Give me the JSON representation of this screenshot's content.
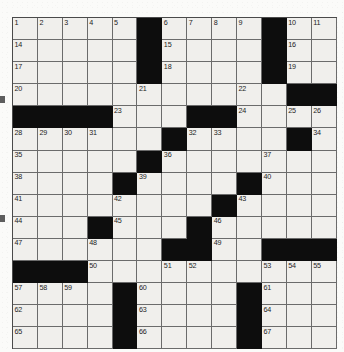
{
  "puzzle": {
    "kind": "crossword-grid",
    "columns": 13,
    "rows": 15,
    "colors": {
      "block": "#0d0d0d",
      "open": "#f0efec",
      "grid_line": "#6b6b6b",
      "border": "#4a4a4a",
      "number_text": "#1d1d1d",
      "paper": "#fbfbf9"
    },
    "clue_number_range": {
      "first": 1,
      "last": 67
    },
    "counts": {
      "total_cells": 195,
      "block_cells": 41,
      "open_cells": 154,
      "numbered_cells": 67
    },
    "rows_data": [
      {
        "row": 1,
        "cells": [
          {
            "type": "white",
            "number": "1"
          },
          {
            "type": "white",
            "number": "2"
          },
          {
            "type": "white",
            "number": "3"
          },
          {
            "type": "white",
            "number": "4"
          },
          {
            "type": "white",
            "number": "5"
          },
          {
            "type": "black",
            "number": ""
          },
          {
            "type": "white",
            "number": "6"
          },
          {
            "type": "white",
            "number": "7"
          },
          {
            "type": "white",
            "number": "8"
          },
          {
            "type": "white",
            "number": "9"
          },
          {
            "type": "black",
            "number": ""
          },
          {
            "type": "white",
            "number": "10"
          },
          {
            "type": "white",
            "number": "11"
          }
        ]
      },
      {
        "row": 2,
        "cells": [
          {
            "type": "white",
            "number": "14"
          },
          {
            "type": "white",
            "number": ""
          },
          {
            "type": "white",
            "number": ""
          },
          {
            "type": "white",
            "number": ""
          },
          {
            "type": "white",
            "number": ""
          },
          {
            "type": "black",
            "number": ""
          },
          {
            "type": "white",
            "number": "15"
          },
          {
            "type": "white",
            "number": ""
          },
          {
            "type": "white",
            "number": ""
          },
          {
            "type": "white",
            "number": ""
          },
          {
            "type": "black",
            "number": ""
          },
          {
            "type": "white",
            "number": "16"
          },
          {
            "type": "white",
            "number": ""
          }
        ]
      },
      {
        "row": 3,
        "cells": [
          {
            "type": "white",
            "number": "17"
          },
          {
            "type": "white",
            "number": ""
          },
          {
            "type": "white",
            "number": ""
          },
          {
            "type": "white",
            "number": ""
          },
          {
            "type": "white",
            "number": ""
          },
          {
            "type": "black",
            "number": ""
          },
          {
            "type": "white",
            "number": "18"
          },
          {
            "type": "white",
            "number": ""
          },
          {
            "type": "white",
            "number": ""
          },
          {
            "type": "white",
            "number": ""
          },
          {
            "type": "black",
            "number": ""
          },
          {
            "type": "white",
            "number": "19"
          },
          {
            "type": "white",
            "number": ""
          }
        ]
      },
      {
        "row": 4,
        "cells": [
          {
            "type": "white",
            "number": "20"
          },
          {
            "type": "white",
            "number": ""
          },
          {
            "type": "white",
            "number": ""
          },
          {
            "type": "white",
            "number": ""
          },
          {
            "type": "white",
            "number": ""
          },
          {
            "type": "white",
            "number": "21"
          },
          {
            "type": "white",
            "number": ""
          },
          {
            "type": "white",
            "number": ""
          },
          {
            "type": "white",
            "number": ""
          },
          {
            "type": "white",
            "number": "22"
          },
          {
            "type": "white",
            "number": ""
          },
          {
            "type": "black",
            "number": ""
          },
          {
            "type": "black",
            "number": ""
          }
        ]
      },
      {
        "row": 5,
        "cells": [
          {
            "type": "black",
            "number": ""
          },
          {
            "type": "black",
            "number": ""
          },
          {
            "type": "black",
            "number": ""
          },
          {
            "type": "black",
            "number": ""
          },
          {
            "type": "white",
            "number": "23"
          },
          {
            "type": "white",
            "number": ""
          },
          {
            "type": "white",
            "number": ""
          },
          {
            "type": "black",
            "number": ""
          },
          {
            "type": "black",
            "number": ""
          },
          {
            "type": "white",
            "number": "24"
          },
          {
            "type": "white",
            "number": ""
          },
          {
            "type": "white",
            "number": "25"
          },
          {
            "type": "white",
            "number": "26"
          }
        ]
      },
      {
        "row": 6,
        "cells": [
          {
            "type": "white",
            "number": "28"
          },
          {
            "type": "white",
            "number": "29"
          },
          {
            "type": "white",
            "number": "30"
          },
          {
            "type": "white",
            "number": "31"
          },
          {
            "type": "white",
            "number": ""
          },
          {
            "type": "white",
            "number": ""
          },
          {
            "type": "black",
            "number": ""
          },
          {
            "type": "white",
            "number": "32"
          },
          {
            "type": "white",
            "number": "33"
          },
          {
            "type": "white",
            "number": ""
          },
          {
            "type": "white",
            "number": ""
          },
          {
            "type": "black",
            "number": ""
          },
          {
            "type": "white",
            "number": "34"
          }
        ]
      },
      {
        "row": 7,
        "cells": [
          {
            "type": "white",
            "number": "35"
          },
          {
            "type": "white",
            "number": ""
          },
          {
            "type": "white",
            "number": ""
          },
          {
            "type": "white",
            "number": ""
          },
          {
            "type": "white",
            "number": ""
          },
          {
            "type": "black",
            "number": ""
          },
          {
            "type": "white",
            "number": "36"
          },
          {
            "type": "white",
            "number": ""
          },
          {
            "type": "white",
            "number": ""
          },
          {
            "type": "white",
            "number": ""
          },
          {
            "type": "white",
            "number": "37"
          },
          {
            "type": "white",
            "number": ""
          },
          {
            "type": "white",
            "number": ""
          }
        ]
      },
      {
        "row": 8,
        "cells": [
          {
            "type": "white",
            "number": "38"
          },
          {
            "type": "white",
            "number": ""
          },
          {
            "type": "white",
            "number": ""
          },
          {
            "type": "white",
            "number": ""
          },
          {
            "type": "black",
            "number": ""
          },
          {
            "type": "white",
            "number": "39"
          },
          {
            "type": "white",
            "number": ""
          },
          {
            "type": "white",
            "number": ""
          },
          {
            "type": "white",
            "number": ""
          },
          {
            "type": "black",
            "number": ""
          },
          {
            "type": "white",
            "number": "40"
          },
          {
            "type": "white",
            "number": ""
          },
          {
            "type": "white",
            "number": ""
          }
        ]
      },
      {
        "row": 9,
        "cells": [
          {
            "type": "white",
            "number": "41"
          },
          {
            "type": "white",
            "number": ""
          },
          {
            "type": "white",
            "number": ""
          },
          {
            "type": "white",
            "number": ""
          },
          {
            "type": "white",
            "number": "42"
          },
          {
            "type": "white",
            "number": ""
          },
          {
            "type": "white",
            "number": ""
          },
          {
            "type": "white",
            "number": ""
          },
          {
            "type": "black",
            "number": ""
          },
          {
            "type": "white",
            "number": "43"
          },
          {
            "type": "white",
            "number": ""
          },
          {
            "type": "white",
            "number": ""
          },
          {
            "type": "white",
            "number": ""
          }
        ]
      },
      {
        "row": 10,
        "cells": [
          {
            "type": "white",
            "number": "44"
          },
          {
            "type": "white",
            "number": ""
          },
          {
            "type": "white",
            "number": ""
          },
          {
            "type": "black",
            "number": ""
          },
          {
            "type": "white",
            "number": "45"
          },
          {
            "type": "white",
            "number": ""
          },
          {
            "type": "white",
            "number": ""
          },
          {
            "type": "black",
            "number": ""
          },
          {
            "type": "white",
            "number": "46"
          },
          {
            "type": "white",
            "number": ""
          },
          {
            "type": "white",
            "number": ""
          },
          {
            "type": "white",
            "number": ""
          },
          {
            "type": "white",
            "number": ""
          }
        ]
      },
      {
        "row": 11,
        "cells": [
          {
            "type": "white",
            "number": "47"
          },
          {
            "type": "white",
            "number": ""
          },
          {
            "type": "white",
            "number": ""
          },
          {
            "type": "white",
            "number": "48"
          },
          {
            "type": "white",
            "number": ""
          },
          {
            "type": "white",
            "number": ""
          },
          {
            "type": "black",
            "number": ""
          },
          {
            "type": "black",
            "number": ""
          },
          {
            "type": "white",
            "number": "49"
          },
          {
            "type": "white",
            "number": ""
          },
          {
            "type": "black",
            "number": ""
          },
          {
            "type": "black",
            "number": ""
          },
          {
            "type": "black",
            "number": ""
          }
        ]
      },
      {
        "row": 12,
        "cells": [
          {
            "type": "black",
            "number": ""
          },
          {
            "type": "black",
            "number": ""
          },
          {
            "type": "black",
            "number": ""
          },
          {
            "type": "white",
            "number": "50"
          },
          {
            "type": "white",
            "number": ""
          },
          {
            "type": "white",
            "number": ""
          },
          {
            "type": "white",
            "number": "51"
          },
          {
            "type": "white",
            "number": "52"
          },
          {
            "type": "white",
            "number": ""
          },
          {
            "type": "white",
            "number": ""
          },
          {
            "type": "white",
            "number": "53"
          },
          {
            "type": "white",
            "number": "54"
          },
          {
            "type": "white",
            "number": "55"
          }
        ]
      },
      {
        "row": 13,
        "cells": [
          {
            "type": "white",
            "number": "57"
          },
          {
            "type": "white",
            "number": "58"
          },
          {
            "type": "white",
            "number": "59"
          },
          {
            "type": "white",
            "number": ""
          },
          {
            "type": "black",
            "number": ""
          },
          {
            "type": "white",
            "number": "60"
          },
          {
            "type": "white",
            "number": ""
          },
          {
            "type": "white",
            "number": ""
          },
          {
            "type": "white",
            "number": ""
          },
          {
            "type": "black",
            "number": ""
          },
          {
            "type": "white",
            "number": "61"
          },
          {
            "type": "white",
            "number": ""
          },
          {
            "type": "white",
            "number": ""
          }
        ]
      },
      {
        "row": 14,
        "cells": [
          {
            "type": "white",
            "number": "62"
          },
          {
            "type": "white",
            "number": ""
          },
          {
            "type": "white",
            "number": ""
          },
          {
            "type": "white",
            "number": ""
          },
          {
            "type": "black",
            "number": ""
          },
          {
            "type": "white",
            "number": "63"
          },
          {
            "type": "white",
            "number": ""
          },
          {
            "type": "white",
            "number": ""
          },
          {
            "type": "white",
            "number": ""
          },
          {
            "type": "black",
            "number": ""
          },
          {
            "type": "white",
            "number": "64"
          },
          {
            "type": "white",
            "number": ""
          },
          {
            "type": "white",
            "number": ""
          }
        ]
      },
      {
        "row": 15,
        "cells": [
          {
            "type": "white",
            "number": "65"
          },
          {
            "type": "white",
            "number": ""
          },
          {
            "type": "white",
            "number": ""
          },
          {
            "type": "white",
            "number": ""
          },
          {
            "type": "black",
            "number": ""
          },
          {
            "type": "white",
            "number": "66"
          },
          {
            "type": "white",
            "number": ""
          },
          {
            "type": "white",
            "number": ""
          },
          {
            "type": "white",
            "number": ""
          },
          {
            "type": "black",
            "number": ""
          },
          {
            "type": "white",
            "number": "67"
          },
          {
            "type": "white",
            "number": ""
          },
          {
            "type": "white",
            "number": ""
          }
        ]
      }
    ],
    "extra_columns": {
      "note_rows_with_13_cols": "rows rendered at 13 columns wide",
      "row1_tail": [
        "12",
        "13"
      ],
      "row2_tail": [
        ""
      ],
      "row3_tail": [
        ""
      ],
      "row5_tail": [
        "27"
      ],
      "row12_tail": [
        "56"
      ]
    }
  }
}
